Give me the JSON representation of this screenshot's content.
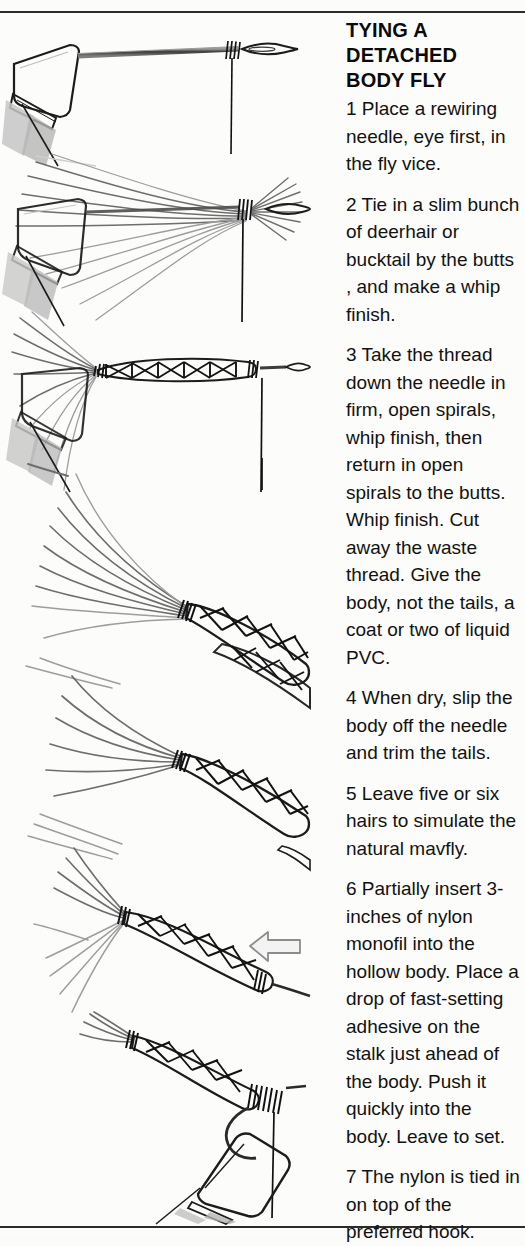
{
  "page": {
    "background_color": "#fcfcfb",
    "ink_color": "#1c1c1c",
    "rule_color": "#2b2b2b"
  },
  "heading": {
    "line1": "TYING A",
    "line2": "DETACHED",
    "line3": "BODY FLY"
  },
  "steps": [
    {
      "number": "1",
      "text": "1 Place a rewiring needle, eye first, in the fly vice.",
      "figure_name": "figure-step-1-needle-in-vice"
    },
    {
      "number": "2",
      "text": "2 Tie in a slim bunch of deerhair or bucktail by the butts , and make a whip finish.",
      "figure_name": "figure-step-2-deerhair-tied-in"
    },
    {
      "number": "3",
      "text": "3 Take the thread down the needle in firm, open spirals, whip finish, then return in open spirals to the butts. Whip finish. Cut away the waste thread. Give the body, not the tails, a coat or two of liquid PVC.",
      "figure_name": "figure-step-3-crisscross-body"
    },
    {
      "number": "4",
      "text": "4 When dry, slip the body off the needle and trim the tails.",
      "figure_name": "figure-step-4-body-off-needle"
    },
    {
      "number": "5",
      "text": "5 Leave five or six hairs to simulate the natural mavfly.",
      "figure_name": "figure-step-5-trimmed-tails"
    },
    {
      "number": "6",
      "text": "6 Partially insert 3-inches of nylon monofil into the hollow body. Place a drop of fast-setting adhesive on the stalk just ahead of the body. Push it quickly into the body. Leave to set.",
      "figure_name": "figure-step-6-nylon-insert"
    },
    {
      "number": "7",
      "text": "7 The nylon is tied in on top of the preferred hook.",
      "figure_name": "figure-step-7-tied-to-hook"
    }
  ],
  "annotations": {
    "arrow_direction": "left",
    "arrow_name": "insertion-direction-arrow"
  }
}
